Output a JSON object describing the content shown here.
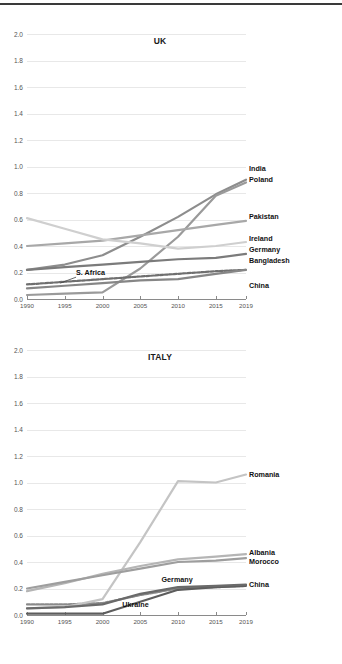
{
  "chart_data": [
    {
      "type": "line",
      "title": "UK",
      "xlabel": "",
      "ylabel": "",
      "xlim": [
        1990,
        2019
      ],
      "ylim": [
        0.0,
        2.0
      ],
      "grid": true,
      "legend_position": "right-end-labels",
      "xticks": [
        1990,
        1995,
        2000,
        2005,
        2010,
        2015,
        2019
      ],
      "yticks": [
        "0.0",
        "0.2",
        "0.4",
        "0.6",
        "0.8",
        "1.0",
        "1.2",
        "1.4",
        "1.6",
        "1.8",
        "2.0"
      ],
      "x": [
        1990,
        1995,
        2000,
        2005,
        2010,
        2015,
        2019
      ],
      "series": [
        {
          "name": "India",
          "values": [
            0.22,
            0.26,
            0.33,
            0.47,
            0.62,
            0.79,
            0.9
          ],
          "color": "#8d8d8d",
          "style": "solid",
          "label_y": 0.98
        },
        {
          "name": "Poland",
          "values": [
            0.03,
            0.04,
            0.05,
            0.23,
            0.47,
            0.78,
            0.88
          ],
          "color": "#9a9a9a",
          "style": "solid",
          "label_y": 0.9
        },
        {
          "name": "Pakistan",
          "values": [
            0.4,
            0.42,
            0.44,
            0.48,
            0.52,
            0.56,
            0.59
          ],
          "color": "#a8a8a8",
          "style": "solid",
          "label_y": 0.62
        },
        {
          "name": "Ireland",
          "values": [
            0.61,
            0.53,
            0.45,
            0.42,
            0.38,
            0.4,
            0.43
          ],
          "color": "#cfcfcf",
          "style": "solid",
          "label_y": 0.45
        },
        {
          "name": "Germany",
          "values": [
            0.22,
            0.24,
            0.26,
            0.28,
            0.3,
            0.31,
            0.34
          ],
          "color": "#7b7b7b",
          "style": "solid",
          "label_y": 0.37
        },
        {
          "name": "Bangladesh",
          "values": [
            0.11,
            0.13,
            0.15,
            0.17,
            0.19,
            0.21,
            0.22
          ],
          "color": "#6f6f6f",
          "style": "dashed",
          "label_y": 0.29
        },
        {
          "name": "China",
          "values": [
            0.08,
            0.1,
            0.12,
            0.14,
            0.15,
            0.19,
            0.22
          ],
          "color": "#868686",
          "style": "solid",
          "label_y": 0.1
        }
      ],
      "annotations": [
        {
          "text": "S. Africa",
          "x": 1996.5,
          "y": 0.195,
          "points_to_x": 1994.4,
          "points_to_y": 0.12
        }
      ]
    },
    {
      "type": "line",
      "title": "ITALY",
      "xlabel": "",
      "ylabel": "",
      "xlim": [
        1990,
        2019
      ],
      "ylim": [
        0.0,
        2.0
      ],
      "grid": true,
      "legend_position": "right-end-labels",
      "xticks": [
        1990,
        1995,
        2000,
        2005,
        2010,
        2015,
        2019
      ],
      "yticks": [
        "0.0",
        "0.2",
        "0.4",
        "0.6",
        "0.8",
        "1.0",
        "1.2",
        "1.4",
        "1.6",
        "1.8",
        "2.0"
      ],
      "x": [
        1990,
        1995,
        2000,
        2005,
        2010,
        2015,
        2019
      ],
      "series": [
        {
          "name": "Romania",
          "values": [
            0.05,
            0.06,
            0.12,
            0.55,
            1.01,
            1.0,
            1.06
          ],
          "color": "#c4c4c4",
          "style": "solid",
          "label_y": 1.06
        },
        {
          "name": "Albania",
          "values": [
            0.18,
            0.24,
            0.31,
            0.37,
            0.42,
            0.44,
            0.46
          ],
          "color": "#b5b5b5",
          "style": "solid",
          "label_y": 0.47
        },
        {
          "name": "Morocco",
          "values": [
            0.2,
            0.25,
            0.3,
            0.35,
            0.4,
            0.41,
            0.43
          ],
          "color": "#9e9e9e",
          "style": "solid",
          "label_y": 0.4
        },
        {
          "name": "China",
          "values": [
            0.05,
            0.06,
            0.08,
            0.16,
            0.21,
            0.22,
            0.23
          ],
          "color": "#6a6a6a",
          "style": "solid",
          "label_y": 0.23
        }
      ],
      "inline_series": [
        {
          "name": "Germany",
          "values": [
            0.08,
            0.08,
            0.09,
            0.15,
            0.2,
            0.21,
            0.22
          ],
          "color": "#8a8a8a",
          "style": "dashed",
          "label_x": 2010.2,
          "label_y": 0.265
        },
        {
          "name": "Ukraine",
          "values": [
            0.01,
            0.01,
            0.01,
            0.1,
            0.19,
            0.21,
            0.22
          ],
          "color": "#5d5d5d",
          "style": "solid",
          "label_x": 2005.0,
          "label_y": 0.075
        }
      ]
    }
  ]
}
